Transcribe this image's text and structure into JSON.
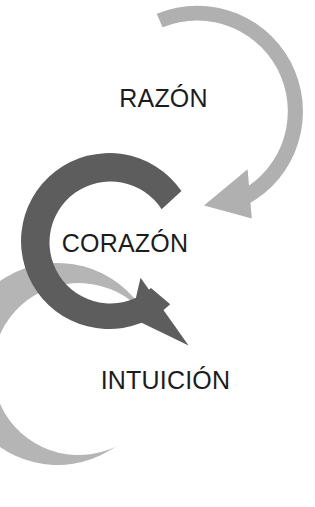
{
  "diagram": {
    "type": "cycle-arrow-diagram",
    "title": "",
    "background_color": "#ffffff",
    "nodes": [
      {
        "id": "razon",
        "label": "RAZÓN",
        "arrow_color": "#b0b0b0",
        "arrow_shape": "circular-arrow",
        "position": "top",
        "center": [
          192,
          113
        ],
        "outer_radius": 103,
        "thickness": 26,
        "sweep_start_deg": 250,
        "sweep_end_deg": 108,
        "arrowhead_direction": "down-left"
      },
      {
        "id": "corazon",
        "label": "CORAZÓN",
        "arrow_color": "#5d5d5d",
        "arrow_shape": "circular-arrow",
        "position": "middle-left",
        "center": [
          116,
          250
        ],
        "outer_radius": 88,
        "thickness": 27,
        "sweep_start_deg": 318,
        "sweep_end_deg": 52,
        "arrowhead_direction": "down-right"
      },
      {
        "id": "intuicion",
        "label": "INTUICIÓN",
        "arrow_color": "#b5b5b5",
        "arrow_shape": "circular-ring-open",
        "position": "bottom",
        "center": [
          193,
          392
        ],
        "outer_radius": 101,
        "thickness": 26,
        "sweep_start_deg": 215,
        "sweep_end_deg": 118,
        "arrowhead_direction": "none"
      }
    ],
    "colors": {
      "light_gray": "#b2b2b2",
      "dark_gray": "#5d5d5d",
      "text": "#1c1c1c",
      "background": "#ffffff"
    }
  }
}
